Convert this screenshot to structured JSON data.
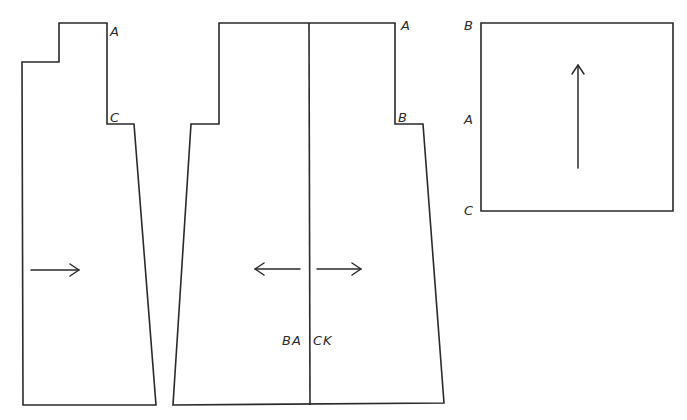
{
  "diagram": {
    "type": "sewing-pattern-pieces",
    "stroke_color": "#2a2a2a",
    "background": "#ffffff",
    "pieces": [
      {
        "id": "front-side",
        "points": [
          [
            59,
            23
          ],
          [
            107,
            23
          ],
          [
            107,
            124
          ],
          [
            134,
            124
          ],
          [
            156,
            405
          ],
          [
            23,
            405
          ],
          [
            22,
            62
          ],
          [
            59,
            62
          ]
        ],
        "labels": [
          {
            "text": "A",
            "x": 110,
            "y": 36
          },
          {
            "text": "C",
            "x": 110,
            "y": 122
          }
        ],
        "grainline": {
          "direction": "right",
          "x1": 31,
          "y1": 270,
          "x2": 79,
          "y2": 270
        }
      },
      {
        "id": "back",
        "points": [
          [
            219,
            23
          ],
          [
            395,
            23
          ],
          [
            395,
            124
          ],
          [
            423,
            124
          ],
          [
            444,
            403
          ],
          [
            173,
            405
          ],
          [
            191,
            124
          ],
          [
            219,
            124
          ]
        ],
        "center_line": {
          "x1": 309,
          "y1": 23,
          "x2": 310,
          "y2": 405
        },
        "labels": [
          {
            "text": "A",
            "x": 401,
            "y": 30
          },
          {
            "text": "B",
            "x": 398,
            "y": 122
          }
        ],
        "title": {
          "left": "BA",
          "right": "CK",
          "x_left": 282,
          "x_right": 313,
          "y": 345
        },
        "grainlines": [
          {
            "direction": "left",
            "x1": 300,
            "y1": 269,
            "x2": 255,
            "y2": 269
          },
          {
            "direction": "right",
            "x1": 317,
            "y1": 269,
            "x2": 361,
            "y2": 269
          }
        ]
      },
      {
        "id": "square",
        "points": [
          [
            481,
            23
          ],
          [
            673,
            23
          ],
          [
            673,
            211
          ],
          [
            481,
            211
          ]
        ],
        "labels": [
          {
            "text": "B",
            "x": 464,
            "y": 30
          },
          {
            "text": "A",
            "x": 464,
            "y": 124
          },
          {
            "text": "C",
            "x": 464,
            "y": 215
          }
        ],
        "grainline": {
          "direction": "up",
          "x1": 578,
          "y1": 168,
          "x2": 578,
          "y2": 65
        }
      }
    ]
  }
}
